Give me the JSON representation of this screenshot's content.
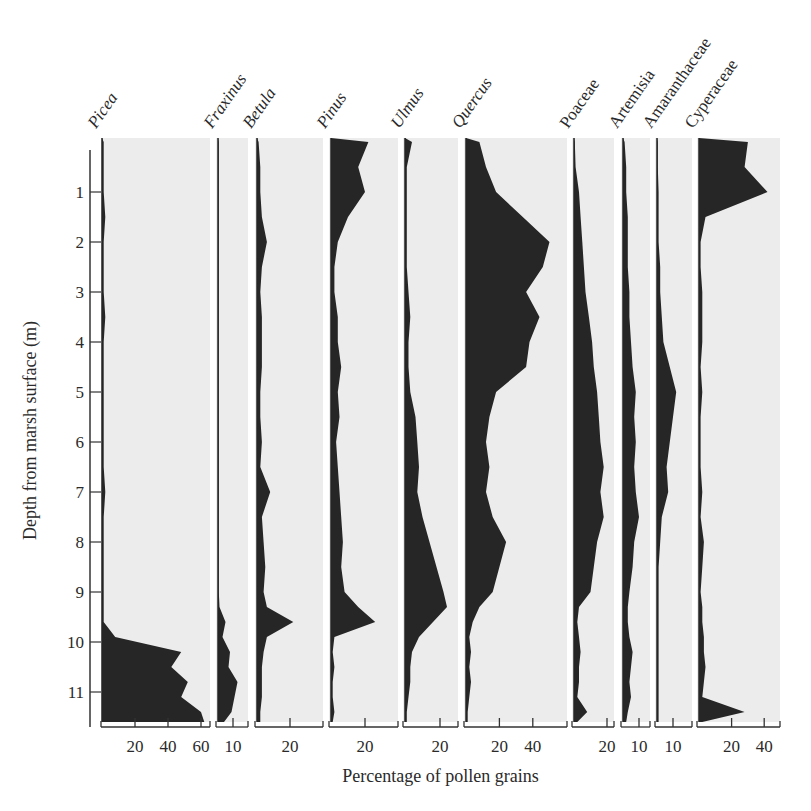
{
  "chart_data": {
    "type": "area",
    "subtype": "stratigraphic pollen diagram (silhouette curves)",
    "xlabel": "Percentage of pollen grains",
    "ylabel": "Depth from marsh surface (m)",
    "ylim": [
      0,
      11.6
    ],
    "y_ticks": [
      1,
      2,
      3,
      4,
      5,
      6,
      7,
      8,
      9,
      10,
      11
    ],
    "depths": [
      0.0,
      0.5,
      1.0,
      1.5,
      2.0,
      2.5,
      3.0,
      3.5,
      4.0,
      4.5,
      5.0,
      5.5,
      6.0,
      6.5,
      7.0,
      7.5,
      8.0,
      8.5,
      9.0,
      9.3,
      9.6,
      9.9,
      10.2,
      10.5,
      10.8,
      11.1,
      11.4,
      11.6
    ],
    "series": [
      {
        "name": "Picea",
        "italic": true,
        "x_ticks": [
          20,
          40,
          60
        ],
        "xmax": 65,
        "values": [
          1,
          1,
          1,
          2,
          1,
          1,
          1,
          2,
          1,
          1,
          1,
          1,
          1,
          1,
          2,
          1,
          1,
          1,
          1,
          1,
          1,
          8,
          48,
          42,
          52,
          48,
          60,
          62
        ]
      },
      {
        "name": "Fraxinus",
        "italic": true,
        "x_ticks": [
          10
        ],
        "xmax": 18,
        "values": [
          0.5,
          0.5,
          0.5,
          0.5,
          0.5,
          0.5,
          0.5,
          0.5,
          0.5,
          0.5,
          0.5,
          0.5,
          0.5,
          0.5,
          0.5,
          0.5,
          0.5,
          0.5,
          0.5,
          1,
          5,
          3,
          8,
          7,
          13,
          11,
          9,
          4
        ]
      },
      {
        "name": "Betula",
        "italic": true,
        "x_ticks": [
          20
        ],
        "xmax": 40,
        "values": [
          1,
          2,
          2,
          3,
          6,
          3,
          2,
          3,
          3,
          3,
          2,
          2,
          3,
          2,
          8,
          3,
          4,
          5,
          4,
          6,
          22,
          6,
          4,
          3,
          3,
          3,
          2,
          2
        ]
      },
      {
        "name": "Pinus",
        "italic": true,
        "x_ticks": [
          20
        ],
        "xmax": 40,
        "values": [
          22,
          16,
          20,
          10,
          4,
          2,
          2,
          4,
          4,
          6,
          4,
          5,
          3,
          4,
          5,
          6,
          7,
          6,
          8,
          16,
          26,
          2,
          1,
          2,
          1,
          1,
          2,
          1
        ]
      },
      {
        "name": "Ulmus",
        "italic": true,
        "x_ticks": [
          20
        ],
        "xmax": 32,
        "values": [
          4,
          1,
          1,
          1,
          1,
          1,
          2,
          3,
          2,
          2,
          3,
          6,
          7,
          8,
          7,
          10,
          14,
          18,
          22,
          24,
          16,
          8,
          4,
          3,
          3,
          2,
          1,
          1
        ]
      },
      {
        "name": "Quercus",
        "italic": true,
        "x_ticks": [
          20,
          40
        ],
        "xmax": 60,
        "values": [
          8,
          12,
          18,
          34,
          50,
          46,
          36,
          44,
          38,
          36,
          18,
          14,
          12,
          14,
          12,
          16,
          24,
          20,
          16,
          8,
          4,
          2,
          3,
          2,
          3,
          2,
          1,
          1
        ]
      },
      {
        "name": "Poaceae",
        "italic": false,
        "x_ticks": [
          20
        ],
        "xmax": 24,
        "values": [
          0.5,
          1,
          3,
          4,
          5,
          6,
          7,
          9,
          11,
          12,
          14,
          15,
          16,
          18,
          16,
          18,
          14,
          12,
          10,
          3,
          2,
          3,
          4,
          3,
          3,
          2,
          8,
          2
        ]
      },
      {
        "name": "Artemisia",
        "italic": false,
        "x_ticks": [
          10
        ],
        "xmax": 16,
        "values": [
          1,
          2,
          2,
          3,
          3,
          3,
          4,
          4,
          5,
          6,
          8,
          7,
          8,
          7,
          8,
          10,
          7,
          6,
          4,
          3,
          3,
          4,
          6,
          5,
          4,
          5,
          3,
          2
        ]
      },
      {
        "name": "Amaranthaceae",
        "italic": false,
        "x_ticks": [
          10
        ],
        "xmax": 22,
        "values": [
          0.5,
          0.5,
          1,
          1,
          1,
          2,
          2,
          3,
          4,
          8,
          12,
          10,
          8,
          6,
          7,
          3,
          2,
          1,
          1,
          1,
          1,
          1,
          1,
          1,
          1,
          1,
          1,
          1
        ]
      },
      {
        "name": "Cyperaceae",
        "italic": false,
        "x_ticks": [
          20,
          40
        ],
        "xmax": 50,
        "values": [
          30,
          28,
          42,
          4,
          1,
          1,
          2,
          2,
          2,
          1,
          2,
          1,
          1,
          1,
          2,
          1,
          3,
          2,
          1,
          2,
          2,
          3,
          3,
          4,
          3,
          2,
          28,
          2
        ]
      }
    ]
  }
}
